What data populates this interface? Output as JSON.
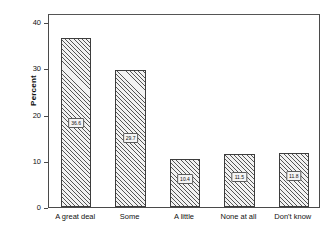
{
  "chart_data": {
    "type": "bar",
    "title": "",
    "subtitle": "",
    "xlabel": "",
    "ylabel": "Percent",
    "categories": [
      "A great deal",
      "Some",
      "A little",
      "None at all",
      "Don't know"
    ],
    "values": [
      36.6,
      29.7,
      10.4,
      11.5,
      11.8
    ],
    "value_labels": [
      "36.6",
      "29.7",
      "10.4",
      "11.5",
      "11.8"
    ],
    "ylim": [
      0,
      42
    ],
    "yticks": [
      0,
      10,
      20,
      30,
      40
    ],
    "ytick_labels": [
      "0",
      "10",
      "20",
      "30",
      "40"
    ],
    "grid": false,
    "legend": "none",
    "bar_fill": "hatched-diagonal",
    "bar_edge_color": "#3d3d3d",
    "frame_color": "#4a4a4a",
    "background": "#ffffff"
  }
}
